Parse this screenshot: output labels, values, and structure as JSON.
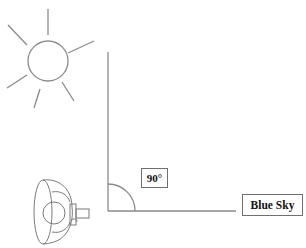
{
  "diagram": {
    "angle_label": "90°",
    "sky_label": "Blue Sky",
    "elements": {
      "sun": "sun-icon",
      "observer_device": "polarizer-camera-icon",
      "vertical_axis": "line",
      "horizontal_axis": "line",
      "right_angle_arc": "arc"
    },
    "colors": {
      "stroke": "#8a8a8a",
      "text": "#111111",
      "background": "#ffffff"
    }
  }
}
